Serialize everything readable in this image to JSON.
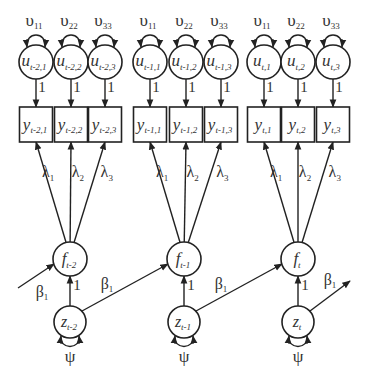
{
  "diagram": {
    "type": "path-diagram",
    "groups": [
      {
        "id": "t-2",
        "indicators": [
          {
            "y_base": "y",
            "y_sub": "t-2,1",
            "u_base": "u",
            "u_sub": "t-2,1",
            "var_base": "υ",
            "var_sub": "11",
            "lambda_base": "λ",
            "lambda_sub": "1"
          },
          {
            "y_base": "y",
            "y_sub": "t-2,2",
            "u_base": "u",
            "u_sub": "t-2,2",
            "var_base": "υ",
            "var_sub": "22",
            "lambda_base": "λ",
            "lambda_sub": "2"
          },
          {
            "y_base": "y",
            "y_sub": "t-2,3",
            "u_base": "u",
            "u_sub": "t-2,3",
            "var_base": "υ",
            "var_sub": "33",
            "lambda_base": "λ",
            "lambda_sub": "3"
          }
        ],
        "factor": {
          "base": "f",
          "sub": "t-2"
        },
        "disturbance": {
          "base": "z",
          "sub": "t-2"
        },
        "psi": "ψ",
        "z_to_f": "1",
        "u_to_y": "1"
      },
      {
        "id": "t-1",
        "indicators": [
          {
            "y_base": "y",
            "y_sub": "t-1,1",
            "u_base": "u",
            "u_sub": "t-1,1",
            "var_base": "υ",
            "var_sub": "11",
            "lambda_base": "λ",
            "lambda_sub": "1"
          },
          {
            "y_base": "y",
            "y_sub": "t-1,2",
            "u_base": "u",
            "u_sub": "t-1,2",
            "var_base": "υ",
            "var_sub": "22",
            "lambda_base": "λ",
            "lambda_sub": "2"
          },
          {
            "y_base": "y",
            "y_sub": "t-1,3",
            "u_base": "u",
            "u_sub": "t-1,3",
            "var_base": "υ",
            "var_sub": "33",
            "lambda_base": "λ",
            "lambda_sub": "3"
          }
        ],
        "factor": {
          "base": "f",
          "sub": "t-1"
        },
        "disturbance": {
          "base": "z",
          "sub": "t-1"
        },
        "psi": "ψ",
        "z_to_f": "1",
        "u_to_y": "1"
      },
      {
        "id": "t",
        "indicators": [
          {
            "y_base": "y",
            "y_sub": "t,1",
            "u_base": "u",
            "u_sub": "t,1",
            "var_base": "υ",
            "var_sub": "11",
            "lambda_base": "λ",
            "lambda_sub": "1"
          },
          {
            "y_base": "y",
            "y_sub": "t,2",
            "u_base": "u",
            "u_sub": "t,2",
            "var_base": "υ",
            "var_sub": "22",
            "lambda_base": "λ",
            "lambda_sub": "2"
          },
          {
            "y_base": "y",
            "y_sub": "t,3",
            "u_base": "u",
            "u_sub": "t,3",
            "var_base": "υ",
            "var_sub": "33",
            "lambda_base": "λ",
            "lambda_sub": "3"
          }
        ],
        "factor": {
          "base": "f",
          "sub": "t"
        },
        "disturbance": {
          "base": "z",
          "sub": "t"
        },
        "psi": "ψ",
        "z_to_f": "1",
        "u_to_y": "1"
      }
    ],
    "beta": {
      "base": "β",
      "sub": "1"
    }
  }
}
